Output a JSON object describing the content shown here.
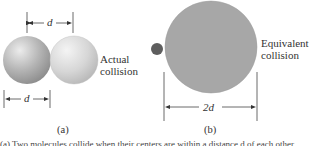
{
  "figure": {
    "panel_a": {
      "label": "(a)",
      "text_line1": "Actual",
      "text_line2": "collision",
      "top_dimension": "d",
      "bottom_dimension": "d",
      "colors": {
        "sphere_left": "#a8a8a8",
        "sphere_right": "#d2d2d2"
      }
    },
    "panel_b": {
      "label": "(b)",
      "text_line1": "Equivalent",
      "text_line2": "collision",
      "dimension": "2d",
      "colors": {
        "large_circle": "#a7a7a7",
        "small_dot": "#5e5e5e"
      }
    },
    "caption": "(a) Two molecules collide when their centers are within a distance d of each other."
  }
}
